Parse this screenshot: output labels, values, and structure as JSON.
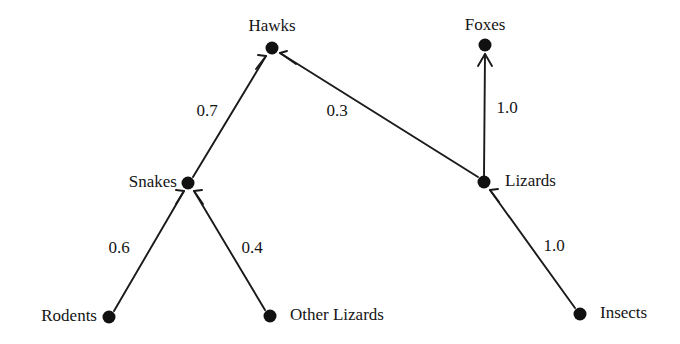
{
  "diagram": {
    "type": "food-web-directed-graph",
    "background_color": "#ffffff",
    "node_color": "#111111",
    "edge_color": "#1a1a1a",
    "nodes": [
      {
        "id": "hawks",
        "label": "Hawks",
        "x": 272,
        "y": 48,
        "label_x": 272,
        "label_y": 25,
        "label_anchor": "center"
      },
      {
        "id": "foxes",
        "label": "Foxes",
        "x": 485,
        "y": 45,
        "label_x": 485,
        "label_y": 24,
        "label_anchor": "center"
      },
      {
        "id": "snakes",
        "label": "Snakes",
        "x": 188,
        "y": 183,
        "label_x": 177,
        "label_y": 181,
        "label_anchor": "right"
      },
      {
        "id": "lizards",
        "label": "Lizards",
        "x": 484,
        "y": 182,
        "label_x": 505,
        "label_y": 180,
        "label_anchor": "left"
      },
      {
        "id": "rodents",
        "label": "Rodents",
        "x": 109,
        "y": 317,
        "label_x": 97,
        "label_y": 315,
        "label_anchor": "right"
      },
      {
        "id": "other_lizards",
        "label": "Other Lizards",
        "x": 270,
        "y": 316,
        "label_x": 290,
        "label_y": 314,
        "label_anchor": "left"
      },
      {
        "id": "insects",
        "label": "Insects",
        "x": 580,
        "y": 314,
        "label_x": 600,
        "label_y": 312,
        "label_anchor": "left"
      }
    ],
    "edges": [
      {
        "id": "snakes-hawks",
        "from": "snakes",
        "to": "hawks",
        "weight": "0.7",
        "label_x": 207,
        "label_y": 110
      },
      {
        "id": "lizards-hawks",
        "from": "lizards",
        "to": "hawks",
        "weight": "0.3",
        "label_x": 337,
        "label_y": 110
      },
      {
        "id": "lizards-foxes",
        "from": "lizards",
        "to": "foxes",
        "weight": "1.0",
        "label_x": 507,
        "label_y": 107
      },
      {
        "id": "rodents-snakes",
        "from": "rodents",
        "to": "snakes",
        "weight": "0.6",
        "label_x": 119,
        "label_y": 247
      },
      {
        "id": "otherlizards-snakes",
        "from": "other_lizards",
        "to": "snakes",
        "weight": "0.4",
        "label_x": 252,
        "label_y": 247
      },
      {
        "id": "insects-lizards",
        "from": "insects",
        "to": "lizards",
        "weight": "1.0",
        "label_x": 554,
        "label_y": 245
      }
    ]
  }
}
